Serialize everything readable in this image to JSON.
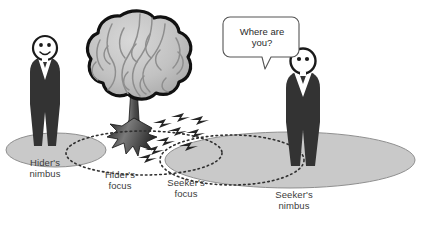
{
  "figure": {
    "background": "#ffffff"
  },
  "colors": {
    "nimbus_fill": "#c9c9c9",
    "nimbus_stroke": "#8c8c8c",
    "focus_stroke": "#3a3a3a",
    "person_body": "#333333",
    "person_shirt": "#ffffff",
    "head_outline": "#1a1a1a",
    "tree_canopy": "#bdbdbd",
    "tree_outline": "#111111",
    "trunk": "#4a4a4a",
    "arrow": "#262626",
    "label_text": "#3b3b3b",
    "bubble_stroke": "#555555"
  },
  "speech_bubble": {
    "name": "speech-bubble",
    "text": "Where are\nyou?",
    "line1": "Where are",
    "line2": "you?"
  },
  "people": [
    {
      "id": "hider",
      "name": "hider-figure",
      "expression": "smiling",
      "x": 45,
      "y": 95
    },
    {
      "id": "seeker",
      "name": "seeker-figure",
      "expression": "neutral",
      "x": 303,
      "y": 110
    }
  ],
  "tree": {
    "name": "brain-tree",
    "description": "tree whose canopy is drawn as a brain"
  },
  "regions": [
    {
      "id": "hider-nimbus",
      "label": "Hider's\nnimbus",
      "line1": "Hider's",
      "line2": "nimbus",
      "style": "filled"
    },
    {
      "id": "hider-focus",
      "label": "Hider's\nfocus",
      "line1": "Hider's",
      "line2": "focus",
      "style": "dotted"
    },
    {
      "id": "seeker-focus",
      "label": "Seeker's\nfocus",
      "line1": "Seeker's",
      "line2": "focus",
      "style": "dotted"
    },
    {
      "id": "seeker-nimbus",
      "label": "Seeker's\nnimbus",
      "line1": "Seeker's",
      "line2": "nimbus",
      "style": "filled"
    }
  ],
  "arrows": {
    "name": "information-flow-arrows",
    "count": 9,
    "description": "small dark arrowheads flowing from the tree toward the seeker's focus"
  }
}
